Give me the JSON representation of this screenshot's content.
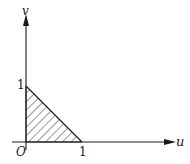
{
  "figure": {
    "type": "region-diagram",
    "axes": {
      "horizontal_label": "u",
      "vertical_label": "v",
      "origin_label": "O"
    },
    "ticks": {
      "u_axis": [
        "1"
      ],
      "v_axis": [
        "1"
      ]
    },
    "region": {
      "vertices": [
        [
          0,
          0
        ],
        [
          1,
          0
        ],
        [
          0,
          1
        ]
      ],
      "fill": "hatched",
      "hatch_direction": "diagonal /"
    },
    "colors": {
      "stroke": "#1a1a1a",
      "background": "#ffffff"
    }
  }
}
